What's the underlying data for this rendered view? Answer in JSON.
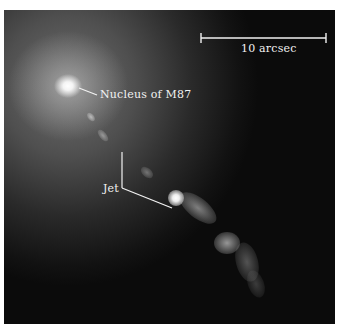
{
  "figure": {
    "labels": {
      "nucleus": "Nucleus of M87",
      "jet": "Jet",
      "scale_bar": "10 arcsec"
    },
    "colors": {
      "background_border": "#ffffff",
      "image_dark": "#0b0b0b",
      "annotation": "#f2f2f2"
    }
  }
}
